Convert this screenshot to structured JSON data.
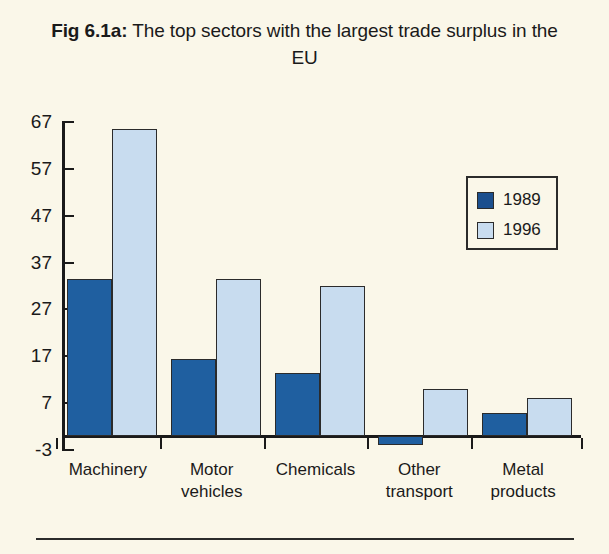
{
  "figure": {
    "label": "Fig 6.1a:",
    "title_rest": " The top sectors with the largest trade surplus in the EU",
    "title_full": "Fig 6.1a: The top sectors with the largest trade surplus in the EU"
  },
  "colors": {
    "background": "#faf7e9",
    "series_1989": "#1f5fa0",
    "series_1996": "#c8dcef",
    "axis": "#1a1a1a",
    "bar_outline": "#2b2b2b"
  },
  "legend": {
    "position": "top-right-inside",
    "items": [
      {
        "label": "1989",
        "color": "#1f5fa0"
      },
      {
        "label": "1996",
        "color": "#c8dcef"
      }
    ]
  },
  "axis": {
    "y_ticks": [
      "67",
      "57",
      "47",
      "37",
      "27",
      "17",
      "7",
      "-3"
    ],
    "y_tick_values": [
      67,
      57,
      47,
      37,
      27,
      17,
      7,
      -3
    ],
    "ylim": [
      -3,
      67
    ],
    "grid": false
  },
  "chart_data": {
    "type": "bar",
    "title": "Fig 6.1a: The top sectors with the largest trade surplus in the EU",
    "xlabel": "",
    "ylabel": "",
    "ylim": [
      -3,
      67
    ],
    "yticks": [
      -3,
      7,
      17,
      27,
      37,
      47,
      57,
      67
    ],
    "grid": false,
    "legend_position": "upper right",
    "categories": [
      "Machinery",
      "Motor vehicles",
      "Chemicals",
      "Other transport",
      "Metal products"
    ],
    "category_lines": [
      [
        "Machinery"
      ],
      [
        "Motor",
        "vehicles"
      ],
      [
        "Chemicals"
      ],
      [
        "Other",
        "transport"
      ],
      [
        "Metal",
        "products"
      ]
    ],
    "series": [
      {
        "name": "1989",
        "color": "#1f5fa0",
        "values": [
          33.5,
          16.5,
          13.5,
          -2,
          5
        ]
      },
      {
        "name": "1996",
        "color": "#c8dcef",
        "values": [
          65.5,
          33.5,
          32,
          10,
          8
        ]
      }
    ]
  }
}
